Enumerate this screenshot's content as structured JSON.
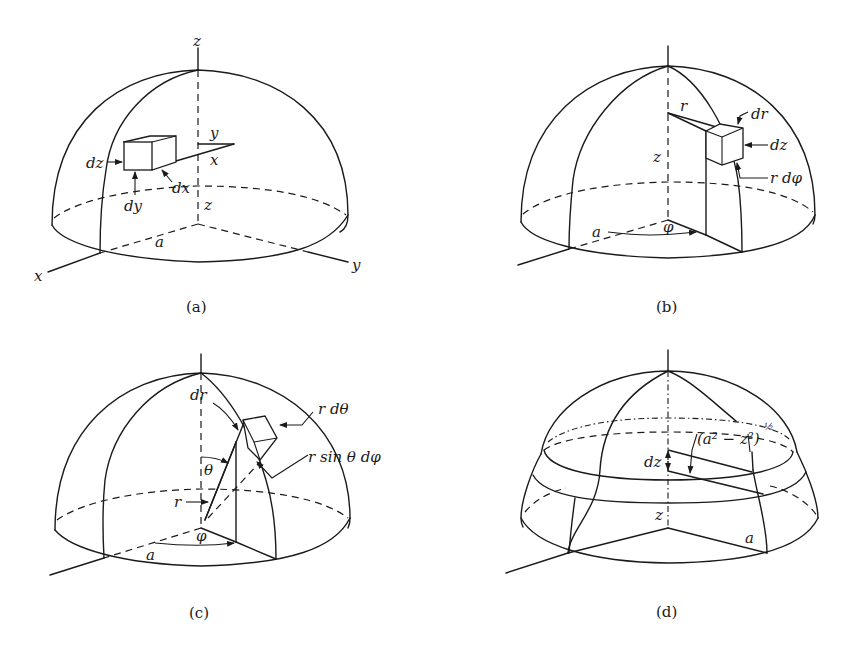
{
  "figure": {
    "panels": [
      {
        "id": "a",
        "caption": "(a)",
        "labels": {
          "z_axis_top": "z",
          "x_axis": "x",
          "y_axis": "y",
          "radius": "a",
          "z_height": "z",
          "inner_y": "y",
          "inner_x": "x",
          "dx": "dx",
          "dy": "dy",
          "dz": "dz"
        }
      },
      {
        "id": "b",
        "caption": "(b)",
        "labels": {
          "r": "r",
          "z_height": "z",
          "radius": "a",
          "phi": "φ",
          "dr": "dr",
          "dz": "dz",
          "r_dphi": "r dφ"
        }
      },
      {
        "id": "c",
        "caption": "(c)",
        "labels": {
          "dr": "dr",
          "r_dtheta": "r dθ",
          "r_sin_theta_dphi": "r sin θ dφ",
          "theta": "θ",
          "r": "r",
          "phi": "φ",
          "radius": "a"
        }
      },
      {
        "id": "d",
        "caption": "(d)",
        "labels": {
          "ring_radius_base": "(a² − z²)",
          "ring_radius_exp": "½",
          "dz": "dz",
          "z_height": "z",
          "radius": "a"
        }
      }
    ]
  }
}
